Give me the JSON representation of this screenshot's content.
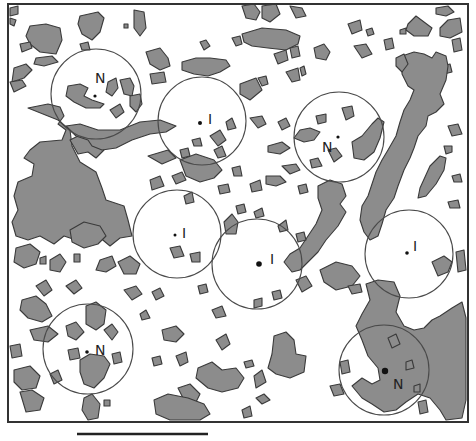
{
  "figure": {
    "type": "habitat-patch map with sampling circles",
    "colors": {
      "background": "#ffffff",
      "patch_fill": "#8c8c8c",
      "patch_stroke": "#3a3a3a",
      "circle_stroke": "#4a4a4a",
      "frame": "#333333"
    },
    "frame": {
      "x": 8,
      "y": 4,
      "width": 460,
      "height": 418
    },
    "scale_bar": {
      "x1": 77,
      "x2": 208,
      "y": 434,
      "label": ""
    },
    "sites": [
      {
        "label": "N",
        "cx": 96,
        "cy": 94,
        "r": 45,
        "label_x": 95,
        "label_y": 83,
        "dot_x": 95,
        "dot_y": 96,
        "dot_r": 1.6
      },
      {
        "label": "I",
        "cx": 202,
        "cy": 121,
        "r": 44,
        "label_x": 208,
        "label_y": 124,
        "dot_x": 200,
        "dot_y": 123,
        "dot_r": 2.0
      },
      {
        "label": "N",
        "cx": 339,
        "cy": 137,
        "r": 45,
        "label_x": 322,
        "label_y": 152,
        "dot_x": 338,
        "dot_y": 137,
        "dot_r": 1.6
      },
      {
        "label": "I",
        "cx": 177,
        "cy": 234,
        "r": 44,
        "label_x": 182,
        "label_y": 238,
        "dot_x": 175,
        "dot_y": 235,
        "dot_r": 1.5
      },
      {
        "label": "I",
        "cx": 257,
        "cy": 264,
        "r": 45,
        "label_x": 270,
        "label_y": 264,
        "dot_x": 259,
        "dot_y": 264,
        "dot_r": 2.8
      },
      {
        "label": "I",
        "cx": 409,
        "cy": 254,
        "r": 44,
        "label_x": 413,
        "label_y": 251,
        "dot_x": 407,
        "dot_y": 253,
        "dot_r": 1.8
      },
      {
        "label": "N",
        "cx": 88,
        "cy": 349,
        "r": 45,
        "label_x": 95,
        "label_y": 355,
        "dot_x": 87,
        "dot_y": 352,
        "dot_r": 1.8
      },
      {
        "label": "N",
        "cx": 384,
        "cy": 370,
        "r": 45,
        "label_x": 393,
        "label_y": 389,
        "dot_x": 385,
        "dot_y": 371,
        "dot_r": 3.2
      }
    ],
    "legend": {
      "N": "nest-centred circle",
      "I": "independent/random circle"
    }
  }
}
